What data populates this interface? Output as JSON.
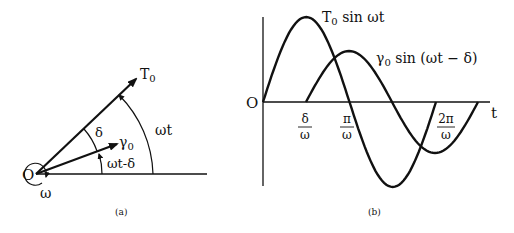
{
  "panel_a": {
    "caption": "(a)",
    "origin_label": "O",
    "omega_label": "ω",
    "phasor_T": "T",
    "phasor_T_sub": "0",
    "phasor_gamma": "γ",
    "phasor_gamma_sub": "0",
    "angle_delta": "δ",
    "angle_wt": "ωt",
    "angle_wt_minus_delta": "ωt-δ"
  },
  "panel_b": {
    "caption": "(b)",
    "origin_label": "O",
    "axis_label_t": "t",
    "curve_T_label": "T",
    "curve_T_sub": "0",
    "curve_T_rest": " sin ωt",
    "curve_gamma_label": "γ",
    "curve_gamma_sub": "0",
    "curve_gamma_rest": " sin (ωt − δ)",
    "ticks": [
      {
        "num": "δ",
        "den": "ω"
      },
      {
        "num": "π",
        "den": "ω"
      },
      {
        "num": "2π",
        "den": "ω"
      }
    ]
  },
  "colors": {
    "ink": "#111111",
    "background": "#ffffff"
  }
}
